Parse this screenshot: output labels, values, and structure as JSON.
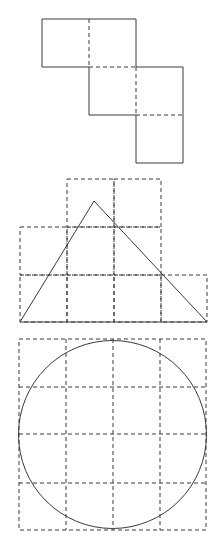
{
  "diagram": {
    "background": "#ffffff",
    "line_color": "#3a3a3a",
    "figures": [
      {
        "name": "square-net",
        "description": "Staircase of four unit squares (cube-style net) with dashed internal fold lines",
        "cell_size": 47,
        "cells": [
          {
            "row": 0,
            "col": 0,
            "x": 42,
            "y": 19
          },
          {
            "row": 0,
            "col": 1,
            "x": 89,
            "y": 19
          },
          {
            "row": 1,
            "col": 1,
            "x": 89,
            "y": 67
          },
          {
            "row": 1,
            "col": 2,
            "x": 136,
            "y": 67
          },
          {
            "row": 2,
            "col": 2,
            "x": 136,
            "y": 115
          }
        ]
      },
      {
        "name": "triangle-on-grid",
        "description": "Triangle drawn over a stepped dashed grid of unit squares",
        "grid_rows": [
          {
            "y": 179,
            "x_start": 67,
            "x_end": 161
          },
          {
            "y": 227,
            "x_start": 20,
            "x_end": 161
          },
          {
            "y": 275,
            "x_start": 20,
            "x_end": 207
          }
        ],
        "grid_bottom": 322,
        "triangle": {
          "apex": [
            94,
            201
          ],
          "base_left": [
            20,
            322
          ],
          "base_right": [
            207,
            322
          ]
        }
      },
      {
        "name": "circle-on-grid",
        "description": "Circle inscribed in a 4x4 dashed grid",
        "grid": {
          "x0": 19,
          "y0": 339,
          "cols": 4,
          "rows": 4,
          "cell_w": 47,
          "cell_h": 47.75
        },
        "circle": {
          "cx": 112.5,
          "cy": 434.5,
          "r": 93.5
        }
      }
    ]
  }
}
